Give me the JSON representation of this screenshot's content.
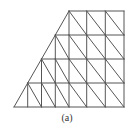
{
  "figure": {
    "caption": "(a)",
    "line_color": "#555555",
    "background": "#ffffff",
    "rows": [
      {
        "y_top": 11,
        "y_bottom": 35,
        "slant_x_top": 69,
        "slant_x_bottom": 55.3,
        "verticals": [
          69,
          86.7,
          105.3,
          124
        ]
      },
      {
        "y_top": 35,
        "y_bottom": 59,
        "slant_x_top": 55.3,
        "slant_x_bottom": 41.5,
        "verticals": [
          55.3,
          69,
          86.7,
          105.3,
          124
        ]
      },
      {
        "y_top": 59,
        "y_bottom": 83,
        "slant_x_top": 41.5,
        "slant_x_bottom": 27.7,
        "verticals": [
          41.5,
          55.3,
          69,
          86.7,
          105.3,
          124
        ]
      },
      {
        "y_top": 83,
        "y_bottom": 107,
        "slant_x_top": 27.7,
        "slant_x_bottom": 14,
        "verticals": [
          27.7,
          41.5,
          55.3,
          69,
          86.7,
          105.3,
          124
        ]
      }
    ]
  }
}
